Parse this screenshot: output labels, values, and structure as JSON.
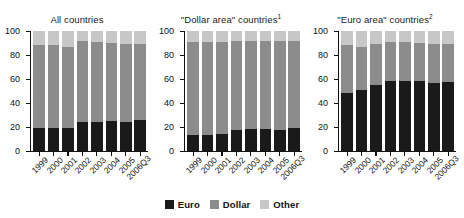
{
  "chart_data": [
    {
      "type": "bar",
      "stacked": true,
      "title": "All countries",
      "title_superscript": "",
      "xlabel": "",
      "ylabel": "",
      "ylim": [
        0,
        100
      ],
      "yticks": [
        0,
        20,
        40,
        60,
        80,
        100
      ],
      "grid": false,
      "categories": [
        "1999",
        "2000",
        "2001",
        "2002",
        "2003",
        "2004",
        "2005",
        "2006Q3"
      ],
      "series": [
        {
          "name": "Euro",
          "color": "#1a1a1a",
          "values": [
            18.5,
            18.5,
            19.0,
            24.0,
            23.8,
            24.8,
            24.3,
            26.0
          ]
        },
        {
          "name": "Dollar",
          "color": "#8c8c8c",
          "values": [
            70.0,
            70.0,
            67.5,
            68.0,
            66.7,
            65.0,
            65.2,
            63.5
          ]
        },
        {
          "name": "Other",
          "color": "#c7c7c7",
          "values": [
            11.5,
            11.5,
            13.5,
            8.0,
            9.5,
            10.2,
            10.5,
            10.5
          ]
        }
      ]
    },
    {
      "type": "bar",
      "stacked": true,
      "title": "\"Dollar area\" countries",
      "title_superscript": "1",
      "xlabel": "",
      "ylabel": "",
      "ylim": [
        0,
        100
      ],
      "yticks": [
        0,
        20,
        40,
        60,
        80,
        100
      ],
      "grid": false,
      "categories": [
        "1999",
        "2000",
        "2001",
        "2002",
        "2003",
        "2004",
        "2005",
        "2006Q3"
      ],
      "series": [
        {
          "name": "Euro",
          "color": "#1a1a1a",
          "values": [
            13.3,
            13.3,
            13.8,
            17.3,
            17.8,
            17.8,
            17.0,
            18.5
          ]
        },
        {
          "name": "Dollar",
          "color": "#8c8c8c",
          "values": [
            77.7,
            77.7,
            77.2,
            74.7,
            74.2,
            74.2,
            75.0,
            73.0
          ]
        },
        {
          "name": "Other",
          "color": "#c7c7c7",
          "values": [
            9.0,
            9.0,
            9.0,
            8.0,
            8.0,
            8.0,
            8.0,
            8.5
          ]
        }
      ]
    },
    {
      "type": "bar",
      "stacked": true,
      "title": "\"Euro area\" countries",
      "title_superscript": "2",
      "xlabel": "",
      "ylabel": "",
      "ylim": [
        0,
        100
      ],
      "yticks": [
        0,
        20,
        40,
        60,
        80,
        100
      ],
      "grid": false,
      "categories": [
        "1999",
        "2000",
        "2001",
        "2002",
        "2003",
        "2004",
        "2005",
        "2006Q3"
      ],
      "series": [
        {
          "name": "Euro",
          "color": "#1a1a1a",
          "values": [
            48.5,
            50.5,
            55.0,
            58.3,
            58.0,
            58.0,
            56.5,
            57.0
          ]
        },
        {
          "name": "Dollar",
          "color": "#8c8c8c",
          "values": [
            39.5,
            36.0,
            34.0,
            32.2,
            32.5,
            32.0,
            32.5,
            31.8
          ]
        },
        {
          "name": "Other",
          "color": "#c7c7c7",
          "values": [
            12.0,
            13.5,
            11.0,
            9.5,
            9.5,
            10.0,
            11.0,
            11.2
          ]
        }
      ]
    }
  ],
  "legend": {
    "position": "bottom-center",
    "items": [
      {
        "label": "Euro",
        "color": "#1a1a1a"
      },
      {
        "label": "Dollar",
        "color": "#8c8c8c"
      },
      {
        "label": "Other",
        "color": "#c7c7c7"
      }
    ]
  }
}
